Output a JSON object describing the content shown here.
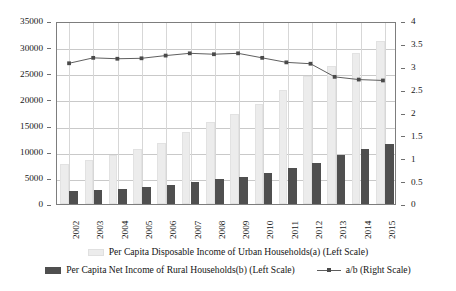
{
  "chart_data": {
    "type": "bar",
    "title": "",
    "subtitle": "",
    "xlabel": "",
    "ylabel": "",
    "grid": true,
    "legend_position": "bottom",
    "categories": [
      "2002",
      "2003",
      "2004",
      "2005",
      "2006",
      "2007",
      "2008",
      "2009",
      "2010",
      "2011",
      "2012",
      "2013",
      "2014",
      "2015"
    ],
    "axes": {
      "left": {
        "label": "",
        "ylim": [
          0,
          35000
        ],
        "ticks": [
          "0",
          "5000",
          "10000",
          "15000",
          "20000",
          "25000",
          "30000",
          "35000"
        ],
        "tick_values": [
          0,
          5000,
          10000,
          15000,
          20000,
          25000,
          30000,
          35000
        ]
      },
      "right": {
        "label": "",
        "ylim": [
          0,
          4
        ],
        "ticks": [
          "0",
          "0.5",
          "1",
          "1.5",
          "2",
          "2.5",
          "3",
          "3.5",
          "4"
        ],
        "tick_values": [
          0,
          0.5,
          1,
          1.5,
          2,
          2.5,
          3,
          3.5,
          4
        ]
      }
    },
    "series": [
      {
        "name": "Per Capita Disposable Income of Urban Households(a) (Left Scale)",
        "key": "urban",
        "type": "bar",
        "axis": "left",
        "color": "#ececec",
        "values": [
          7703,
          8472,
          9422,
          10493,
          11760,
          13786,
          15781,
          17175,
          19109,
          21810,
          24565,
          26467,
          28844,
          31195
        ]
      },
      {
        "name": "Per Capita Net Income of Rural Households(b) (Left Scale)",
        "key": "rural",
        "type": "bar",
        "axis": "left",
        "color": "#4f4f4f",
        "values": [
          2476,
          2622,
          2936,
          3255,
          3587,
          4140,
          4761,
          5153,
          5919,
          6977,
          7917,
          9430,
          10489,
          11422
        ]
      },
      {
        "name": "a/b (Right Scale)",
        "key": "ratio",
        "type": "line",
        "axis": "right",
        "color": "#5d5d5d",
        "values": [
          3.11,
          3.23,
          3.21,
          3.22,
          3.28,
          3.33,
          3.31,
          3.33,
          3.23,
          3.13,
          3.1,
          2.81,
          2.75,
          2.73
        ]
      }
    ],
    "legend": [
      {
        "label": "Per Capita Disposable Income of Urban Households(a) (Left Scale)",
        "marker": "urban-swatch"
      },
      {
        "label": "Per Capita Net Income of Rural Households(b) (Left Scale)",
        "marker": "rural-swatch"
      },
      {
        "label": "a/b (Right Scale)",
        "marker": "line-swatch"
      }
    ]
  }
}
